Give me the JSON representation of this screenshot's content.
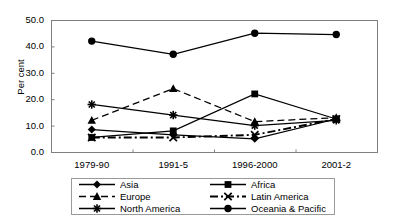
{
  "chart_data": {
    "type": "line",
    "title": "",
    "subtitle": "",
    "xlabel": "",
    "ylabel": "Per cent",
    "categories": [
      "1979-90",
      "1991-5",
      "1996-2000",
      "2001-2"
    ],
    "ylim": [
      0.0,
      50.0
    ],
    "ytick_labels": [
      "50.0",
      "40.0",
      "30.0",
      "20.0",
      "10.0",
      "0.0"
    ],
    "ytick_values": [
      50.0,
      40.0,
      30.0,
      20.0,
      10.0,
      0.0
    ],
    "grid": false,
    "legend_position": "bottom",
    "series": [
      {
        "name": "Asia",
        "marker": "diamond",
        "line_style": "solid",
        "color": "#000000",
        "values": [
          8.5,
          6.5,
          5.0,
          12.5
        ]
      },
      {
        "name": "Africa",
        "marker": "square",
        "line_style": "solid",
        "color": "#000000",
        "values": [
          5.5,
          8.0,
          22.0,
          12.5
        ]
      },
      {
        "name": "Europe",
        "marker": "triangle",
        "line_style": "dashed",
        "color": "#000000",
        "values": [
          12.0,
          24.0,
          11.5,
          13.0
        ]
      },
      {
        "name": "Latin America",
        "marker": "cross",
        "line_style": "dash-dot",
        "color": "#000000",
        "values": [
          5.5,
          5.5,
          6.5,
          12.5
        ]
      },
      {
        "name": "North America",
        "marker": "asterisk",
        "line_style": "solid",
        "color": "#000000",
        "values": [
          18.0,
          14.0,
          10.0,
          12.0
        ]
      },
      {
        "name": "Oceania & Pacific",
        "marker": "circle",
        "line_style": "solid",
        "color": "#000000",
        "values": [
          42.0,
          37.0,
          45.0,
          44.5
        ]
      }
    ]
  },
  "axis": {
    "y_title": "Per cent",
    "y_ticks": [
      "50.0",
      "40.0",
      "30.0",
      "20.0",
      "10.0",
      "0.0"
    ],
    "x_ticks": [
      "1979-90",
      "1991-5",
      "1996-2000",
      "2001-2"
    ]
  },
  "legend": {
    "entries": [
      {
        "label": "Asia"
      },
      {
        "label": "Africa"
      },
      {
        "label": "Europe"
      },
      {
        "label": "Latin America"
      },
      {
        "label": "North America"
      },
      {
        "label": "Oceania & Pacific"
      }
    ]
  },
  "colors": {
    "plot_line": "#000000",
    "axis": "#808080",
    "legend_border": "#9a9a9a",
    "background": "#ffffff"
  }
}
